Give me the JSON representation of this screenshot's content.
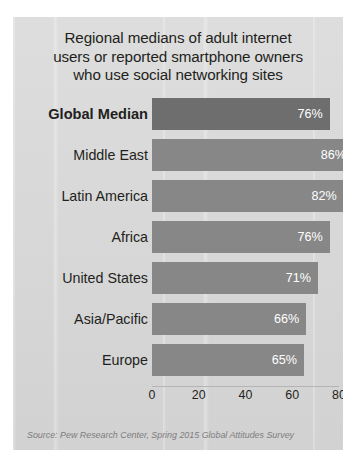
{
  "chart_data": {
    "type": "bar",
    "orientation": "horizontal",
    "title_lines": [
      "Regional medians of adult internet",
      "users or reported smartphone owners",
      "who use social networking sites"
    ],
    "categories": [
      "Global Median",
      "Middle East",
      "Latin America",
      "Africa",
      "United States",
      "Asia/Pacific",
      "Europe"
    ],
    "values": [
      76,
      86,
      82,
      76,
      71,
      66,
      65
    ],
    "value_labels": [
      "76%",
      "86%",
      "82%",
      "76%",
      "71%",
      "66%",
      "65%"
    ],
    "highlight_index": 0,
    "xlabel": "",
    "ylabel": "",
    "xlim": [
      0,
      80
    ],
    "xticks": [
      0,
      20,
      40,
      60,
      80
    ],
    "xtick_labels": [
      "0",
      "20",
      "40",
      "60",
      "80"
    ],
    "grid": false,
    "legend": null,
    "source": "Source: Pew Research Center, Spring 2015 Global Attitudes Survey",
    "colors": {
      "bar": "#878787",
      "bar_highlight": "#6e6e6e",
      "value_text": "#ffffff",
      "panel_background": "#d6d6d6",
      "text": "#231f20",
      "source_text": "#7d7d7d"
    }
  }
}
